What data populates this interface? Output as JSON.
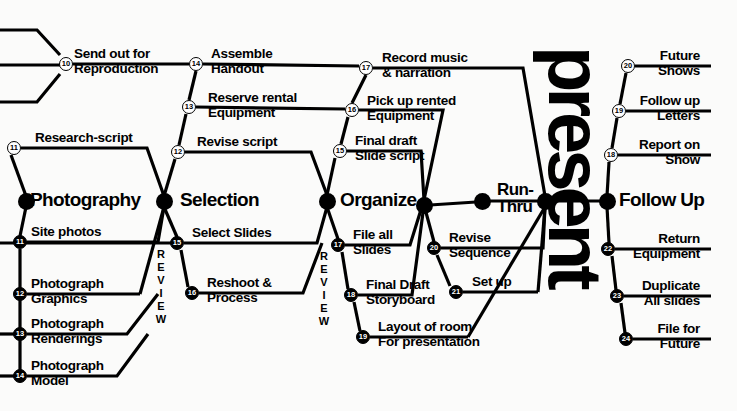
{
  "diagram": {
    "title": "present",
    "review_label": "REVIEW",
    "milestones": [
      {
        "id": "photography",
        "label": "Photography",
        "x": 26,
        "y": 201,
        "text_x": 30,
        "text_y": 190
      },
      {
        "id": "selection",
        "label": "Selection",
        "x": 164,
        "y": 201,
        "text_x": 180,
        "text_y": 190
      },
      {
        "id": "organize",
        "label": "Organize",
        "x": 327,
        "y": 201,
        "text_x": 340,
        "text_y": 190
      },
      {
        "id": "organize-end",
        "label": "",
        "x": 424,
        "y": 205,
        "text_x": 0,
        "text_y": 0
      },
      {
        "id": "run-thru",
        "label": "Run-\nThru",
        "x": 482,
        "y": 201,
        "text_x": 497,
        "text_y": 181
      },
      {
        "id": "present-node",
        "label": "",
        "x": 545,
        "y": 201,
        "text_x": 0,
        "text_y": 0
      },
      {
        "id": "follow-up",
        "label": "Follow Up",
        "x": 607,
        "y": 201,
        "text_x": 619,
        "text_y": 190
      }
    ],
    "activities": [
      {
        "num": "10",
        "label": "Send out for\nReproduction",
        "node_x": 66,
        "node_y": 64,
        "filled": false,
        "text_x": 74,
        "text_y": 47,
        "align": "left"
      },
      {
        "num": "11",
        "label": "Research-script",
        "node_x": 14,
        "node_y": 148,
        "filled": false,
        "text_x": 35,
        "text_y": 131,
        "align": "left"
      },
      {
        "num": "14",
        "label": "Assemble\nHandout",
        "node_x": 196,
        "node_y": 64,
        "filled": false,
        "text_x": 211,
        "text_y": 47,
        "align": "left"
      },
      {
        "num": "13",
        "label": "Reserve rental\nEquipment",
        "node_x": 189,
        "node_y": 107,
        "filled": false,
        "text_x": 208,
        "text_y": 91,
        "align": "left"
      },
      {
        "num": "12",
        "label": "Revise script",
        "node_x": 178,
        "node_y": 152,
        "filled": false,
        "text_x": 197,
        "text_y": 135,
        "align": "left"
      },
      {
        "num": "17",
        "label": "Record music\n& narration",
        "node_x": 366,
        "node_y": 68,
        "filled": false,
        "text_x": 382,
        "text_y": 51,
        "align": "left"
      },
      {
        "num": "16",
        "label": "Pick up rented\nEquipment",
        "node_x": 352,
        "node_y": 110,
        "filled": false,
        "text_x": 367,
        "text_y": 94,
        "align": "left"
      },
      {
        "num": "15",
        "label": "Final draft\nSlide script",
        "node_x": 340,
        "node_y": 151,
        "filled": false,
        "text_x": 355,
        "text_y": 134,
        "align": "left"
      },
      {
        "num": "20",
        "label": "Future\nShows",
        "node_x": 628,
        "node_y": 66,
        "filled": false,
        "text_x": 700,
        "text_y": 49,
        "align": "right"
      },
      {
        "num": "19",
        "label": "Follow up\nLetters",
        "node_x": 619,
        "node_y": 111,
        "filled": false,
        "text_x": 700,
        "text_y": 94,
        "align": "right"
      },
      {
        "num": "18",
        "label": "Report on\nShow",
        "node_x": 611,
        "node_y": 155,
        "filled": false,
        "text_x": 700,
        "text_y": 138,
        "align": "right"
      },
      {
        "num": "11",
        "label": "Site photos",
        "node_x": 20,
        "node_y": 242,
        "filled": true,
        "text_x": 31,
        "text_y": 225,
        "align": "left"
      },
      {
        "num": "12",
        "label": "Photograph\nGraphics",
        "node_x": 20,
        "node_y": 294,
        "filled": true,
        "text_x": 31,
        "text_y": 277,
        "align": "left"
      },
      {
        "num": "13",
        "label": "Photograph\nRenderings",
        "node_x": 20,
        "node_y": 334,
        "filled": true,
        "text_x": 31,
        "text_y": 317,
        "align": "left"
      },
      {
        "num": "14",
        "label": "Photograph\nModel",
        "node_x": 20,
        "node_y": 376,
        "filled": true,
        "text_x": 31,
        "text_y": 359,
        "align": "left"
      },
      {
        "num": "15",
        "label": "Select Slides",
        "node_x": 177,
        "node_y": 243,
        "filled": true,
        "text_x": 192,
        "text_y": 226,
        "align": "left"
      },
      {
        "num": "16",
        "label": "Reshoot &\nProcess",
        "node_x": 192,
        "node_y": 293,
        "filled": true,
        "text_x": 207,
        "text_y": 276,
        "align": "left"
      },
      {
        "num": "17",
        "label": "File all\nSlides",
        "node_x": 338,
        "node_y": 245,
        "filled": true,
        "text_x": 353,
        "text_y": 228,
        "align": "left"
      },
      {
        "num": "18",
        "label": "Final Draft\nStoryboard",
        "node_x": 351,
        "node_y": 295,
        "filled": true,
        "text_x": 366,
        "text_y": 278,
        "align": "left"
      },
      {
        "num": "19",
        "label": "Layout of room\nFor presentation",
        "node_x": 363,
        "node_y": 337,
        "filled": true,
        "text_x": 378,
        "text_y": 320,
        "align": "left"
      },
      {
        "num": "20",
        "label": "Revise\nSequence",
        "node_x": 434,
        "node_y": 248,
        "filled": true,
        "text_x": 449,
        "text_y": 231,
        "align": "left"
      },
      {
        "num": "21",
        "label": "Set up",
        "node_x": 456,
        "node_y": 292,
        "filled": true,
        "text_x": 472,
        "text_y": 275,
        "align": "left"
      },
      {
        "num": "22",
        "label": "Return\nEquipment",
        "node_x": 608,
        "node_y": 249,
        "filled": true,
        "text_x": 700,
        "text_y": 232,
        "align": "right"
      },
      {
        "num": "23",
        "label": "Duplicate\nAll slides",
        "node_x": 617,
        "node_y": 296,
        "filled": true,
        "text_x": 700,
        "text_y": 279,
        "align": "right"
      },
      {
        "num": "24",
        "label": "File for\nFuture",
        "node_x": 626,
        "node_y": 339,
        "filled": true,
        "text_x": 700,
        "text_y": 322,
        "align": "right"
      },
      {
        "num": "21b",
        "label": "",
        "node_x": 0,
        "node_y": 0,
        "filled": true,
        "text_x": 0,
        "text_y": 0,
        "align": "left"
      }
    ],
    "review_markers": [
      {
        "x": 160,
        "y": 250
      },
      {
        "x": 323,
        "y": 252
      }
    ],
    "colors": {
      "ink": "#000000",
      "paper": "#fbfbfa"
    }
  }
}
